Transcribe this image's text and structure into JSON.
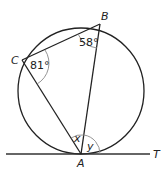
{
  "diagram": {
    "points": {
      "A": "A",
      "B": "B",
      "C": "C",
      "T": "T"
    },
    "angles": {
      "C": "81°",
      "B": "58°",
      "x": "x",
      "y": "y"
    },
    "colors": {
      "stroke": "#222222",
      "arc": "#888888",
      "background": "#ffffff"
    }
  }
}
